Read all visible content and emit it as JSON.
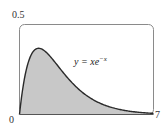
{
  "chart_data": {
    "type": "area",
    "title": "",
    "function": "y = x e^{-x}",
    "annotation": {
      "text_lhs": "y = xe",
      "exponent": "−x"
    },
    "xlabel": "",
    "ylabel": "",
    "xlim": [
      0,
      7
    ],
    "ylim": [
      0,
      0.5
    ],
    "x_tick_labels": [
      "0",
      "7"
    ],
    "y_tick_labels": [
      "0.5"
    ],
    "grid": false,
    "legend": null,
    "shaded_region": "area under curve from x=0 to x=7",
    "x": [
      0,
      0.25,
      0.5,
      0.75,
      1,
      1.5,
      2,
      2.5,
      3,
      3.5,
      4,
      5,
      6,
      7
    ],
    "values": [
      0,
      0.195,
      0.303,
      0.354,
      0.368,
      0.335,
      0.271,
      0.205,
      0.149,
      0.106,
      0.073,
      0.034,
      0.015,
      0.006
    ]
  },
  "labels": {
    "ymax": "0.5",
    "xmin": "0",
    "xmax": "7",
    "eq_main": "y = xe",
    "eq_exp": "−x"
  },
  "colors": {
    "fill": "#c8c8c8",
    "curve": "#2a2a2a",
    "frame": "#8a8a8a"
  }
}
